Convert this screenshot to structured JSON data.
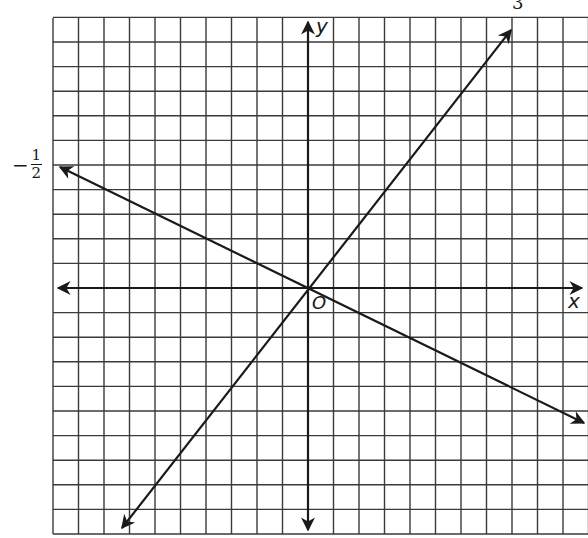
{
  "diagram": {
    "type": "coordinate-grid",
    "axes": {
      "x_label": "x",
      "y_label": "y",
      "origin_label": "O"
    },
    "grid": {
      "left": 53,
      "top": 18,
      "bottom": 534,
      "right": 588,
      "origin_px": [
        308,
        288
      ],
      "cell_w": 25.5,
      "cell_h": 24.6,
      "cells_left": 10,
      "cells_right": 11,
      "cells_up": 11,
      "cells_down": 10
    },
    "lines": [
      {
        "name": "line-slope-3",
        "label": "3",
        "from": [
          122,
          528
        ],
        "to": [
          511,
          30
        ]
      },
      {
        "name": "line-slope-neg-half",
        "label_sign": "−",
        "label_num": "1",
        "label_den": "2",
        "from": [
          60,
          167
        ],
        "to": [
          584,
          423
        ]
      }
    ],
    "colors": {
      "grid": "#3a3a3a",
      "line": "#1a1a1a",
      "background": "#ffffff"
    }
  }
}
